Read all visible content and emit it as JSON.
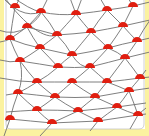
{
  "image": {
    "width": 149,
    "height": 136,
    "description": "Decorative warped lattice pattern of crossing curved gray lines with red half-circles sitting on intersections, framed by a pale yellow border",
    "colors": {
      "background": "#ffffff",
      "border": "#fbf2a0",
      "inner_outline": "#b8b8b8",
      "lines": "#6e6e6e",
      "dots": "#e01e10"
    }
  },
  "pattern": {
    "dot_radius": 5,
    "dots": [
      [
        15,
        7
      ],
      [
        41,
        12
      ],
      [
        76,
        14
      ],
      [
        107,
        10
      ],
      [
        133,
        6
      ],
      [
        27,
        27
      ],
      [
        57,
        35
      ],
      [
        91,
        32
      ],
      [
        123,
        26
      ],
      [
        10,
        39
      ],
      [
        40,
        48
      ],
      [
        72,
        55
      ],
      [
        108,
        48
      ],
      [
        137,
        41
      ],
      [
        20,
        61
      ],
      [
        58,
        67
      ],
      [
        90,
        67
      ],
      [
        125,
        58
      ],
      [
        37,
        82
      ],
      [
        72,
        82
      ],
      [
        107,
        82
      ],
      [
        140,
        78
      ],
      [
        18,
        93
      ],
      [
        55,
        97
      ],
      [
        95,
        97
      ],
      [
        129,
        91
      ],
      [
        37,
        110
      ],
      [
        78,
        111
      ],
      [
        117,
        107
      ],
      [
        10,
        119
      ],
      [
        52,
        123
      ],
      [
        98,
        121
      ],
      [
        138,
        115
      ]
    ]
  }
}
